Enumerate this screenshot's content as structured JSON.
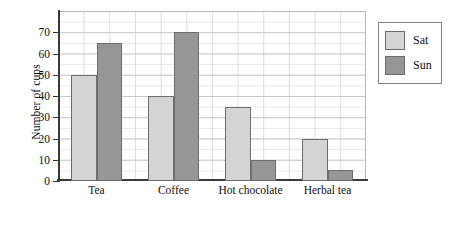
{
  "chart_data": {
    "type": "bar",
    "title": "",
    "xlabel": "",
    "ylabel": "Number of cups",
    "categories": [
      "Tea",
      "Coffee",
      "Hot chocolate",
      "Herbal tea"
    ],
    "series": [
      {
        "name": "Sat",
        "color": "#d4d4d4",
        "values": [
          50,
          40,
          35,
          20
        ]
      },
      {
        "name": "Sun",
        "color": "#969696",
        "values": [
          65,
          70,
          10,
          5
        ]
      }
    ],
    "ylim": [
      0,
      80
    ],
    "yticks": [
      0,
      10,
      20,
      30,
      40,
      50,
      60,
      70
    ],
    "ytick_labels": [
      "0",
      "10",
      "20",
      "30",
      "40",
      "50",
      "60",
      "70"
    ],
    "grid": true,
    "grid_minor_step": 5,
    "legend_position": "right-outside",
    "legend_entries": [
      "Sat",
      "Sun"
    ]
  },
  "axis": {
    "y_title": "Number of cups"
  },
  "legend": {
    "items": [
      {
        "label": "Sat"
      },
      {
        "label": "Sun"
      }
    ]
  }
}
